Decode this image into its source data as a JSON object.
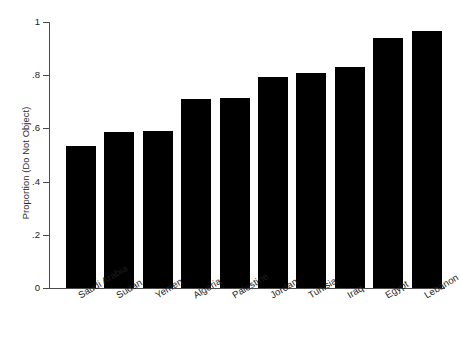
{
  "chart_data": {
    "type": "bar",
    "title": "",
    "subtitle": "",
    "xlabel": "",
    "ylabel": "Proportion (Do Not Object)",
    "categories": [
      "Saudi Arabia",
      "Sudan",
      "Yemen",
      "Algeria",
      "Palestine",
      "Jordan",
      "Tunisia",
      "Iraq",
      "Egypt",
      "Lebanon"
    ],
    "values": [
      0.535,
      0.585,
      0.59,
      0.71,
      0.715,
      0.795,
      0.81,
      0.83,
      0.94,
      0.965
    ],
    "ylim": [
      0,
      1.0
    ],
    "yticks": [
      0,
      0.2,
      0.4,
      0.6,
      0.8,
      1.0
    ],
    "ytick_labels": [
      "0",
      ".2",
      ".4",
      ".6",
      ".8",
      "1"
    ],
    "grid": false,
    "legend": null,
    "bar_color": "#000000",
    "axis_color": "#4a4a4a",
    "background": "#ffffff",
    "xtick_rotation": -31,
    "frame": "left-bottom"
  }
}
